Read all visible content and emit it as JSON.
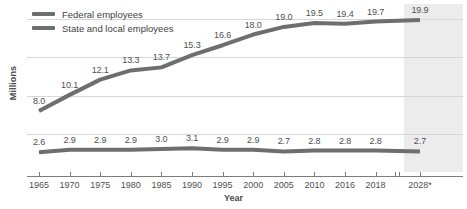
{
  "chart_data": {
    "type": "line",
    "title": "",
    "xlabel": "Year",
    "ylabel": "Millions",
    "categories": [
      "1965",
      "1970",
      "1975",
      "1980",
      "1985",
      "1990",
      "1995",
      "2000",
      "2005",
      "2010",
      "2016",
      "2018",
      "2028*"
    ],
    "series": [
      {
        "name": "State and local employees",
        "color": "#6e6e70",
        "values": [
          8.0,
          10.1,
          12.1,
          13.3,
          13.7,
          15.3,
          16.6,
          18.0,
          19.0,
          19.5,
          19.4,
          19.7,
          19.9
        ],
        "labels": [
          "8.0",
          "10.1",
          "12.1",
          "13.3",
          "13.7",
          "15.3",
          "16.6",
          "18.0",
          "19.0",
          "19.5",
          "19.4",
          "19.7",
          "19.9"
        ]
      },
      {
        "name": "Federal employees",
        "color": "#6e6e70",
        "values": [
          2.6,
          2.9,
          2.9,
          2.9,
          3.0,
          3.1,
          2.9,
          2.9,
          2.7,
          2.8,
          2.8,
          2.8,
          2.7
        ],
        "labels": [
          "2.6",
          "2.9",
          "2.9",
          "2.9",
          "3.0",
          "3.1",
          "2.9",
          "2.9",
          "2.7",
          "2.8",
          "2.8",
          "2.8",
          "2.7"
        ]
      }
    ],
    "ylim": [
      0,
      22
    ],
    "gridlines": [
      5,
      10,
      15,
      20
    ],
    "grid": true,
    "legend_position": "top-left",
    "axis_break": {
      "after_category": "2018",
      "before_category": "2028*"
    },
    "forecast_region": {
      "category": "2028*",
      "shaded": true,
      "color": "#ececec"
    }
  },
  "legend": {
    "entries": [
      {
        "label": "Federal employees",
        "color": "#6e6e70"
      },
      {
        "label": "State and local employees",
        "color": "#6e6e70"
      }
    ]
  }
}
